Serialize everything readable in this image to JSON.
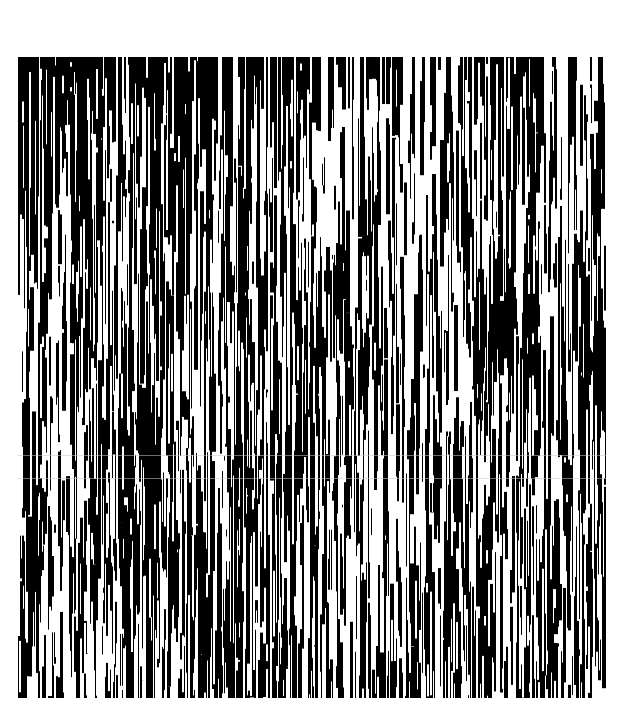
{
  "image": {
    "description": "Black and white stochastic vertical-streak texture",
    "background": "#ffffff",
    "ink": "#000000",
    "frame": {
      "left": 18,
      "top": 57,
      "width": 588,
      "height": 641
    },
    "streak": {
      "min_width": 2,
      "max_width": 5,
      "min_len": 20,
      "max_len": 160,
      "count": 2600,
      "seed": 7
    },
    "density_grid": {
      "cols": 8,
      "rows": 8,
      "values": [
        [
          0.75,
          0.7,
          0.8,
          0.75,
          0.35,
          0.25,
          0.85,
          0.4
        ],
        [
          0.55,
          0.45,
          0.85,
          0.75,
          0.3,
          0.4,
          0.8,
          0.35
        ],
        [
          0.35,
          0.75,
          0.6,
          0.7,
          0.55,
          0.45,
          0.8,
          0.55
        ],
        [
          0.25,
          0.8,
          0.45,
          0.7,
          0.8,
          0.7,
          0.55,
          0.75
        ],
        [
          0.55,
          0.85,
          0.6,
          0.55,
          0.85,
          0.45,
          0.6,
          0.45
        ],
        [
          0.65,
          0.7,
          0.8,
          0.7,
          0.4,
          0.3,
          0.65,
          0.55
        ],
        [
          0.35,
          0.7,
          0.75,
          0.8,
          0.55,
          0.7,
          0.75,
          0.45
        ],
        [
          0.4,
          0.75,
          0.6,
          0.8,
          0.65,
          0.8,
          0.7,
          0.4
        ]
      ]
    },
    "scanlines_y": [
      455,
      478
    ]
  }
}
